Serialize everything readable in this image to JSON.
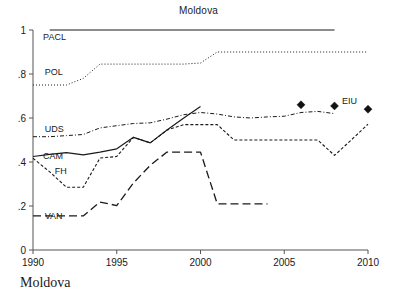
{
  "figure": {
    "title": "Moldova",
    "caption": "Moldova"
  },
  "chart_data": {
    "type": "line",
    "title": "Moldova",
    "xlabel": "",
    "ylabel": "",
    "xlim": [
      1990,
      2010
    ],
    "ylim": [
      0,
      1
    ],
    "grid": false,
    "legend": "inline-labels",
    "xticks": [
      "1990",
      "1995",
      "2000",
      "2005",
      "2010"
    ],
    "yticks": [
      "0",
      ".2",
      ".4",
      ".6",
      ".8",
      "1"
    ],
    "ytick_values": [
      0,
      0.2,
      0.4,
      0.6,
      0.8,
      1
    ],
    "xtick_values": [
      1990,
      1995,
      2000,
      2005,
      2010
    ],
    "series": [
      {
        "name": "PACL",
        "label": "PACL",
        "style": "solid",
        "label_x": 1990.6,
        "label_y": 0.955,
        "x": [
          1991,
          1992,
          1993,
          1994,
          1995,
          1996,
          1997,
          1998,
          1999,
          2000,
          2001,
          2002,
          2003,
          2004,
          2005,
          2006,
          2007,
          2008
        ],
        "values": [
          1,
          1,
          1,
          1,
          1,
          1,
          1,
          1,
          1,
          1,
          1,
          1,
          1,
          1,
          1,
          1,
          1,
          1
        ]
      },
      {
        "name": "POL",
        "label": "POL",
        "style": "dotted",
        "label_x": 1990.7,
        "label_y": 0.795,
        "x": [
          1990,
          1991,
          1992,
          1993,
          1994,
          1995,
          1996,
          1997,
          1998,
          1999,
          2000,
          2001,
          2002,
          2003,
          2004,
          2005,
          2006,
          2007,
          2008,
          2009,
          2010
        ],
        "values": [
          0.75,
          0.75,
          0.75,
          0.78,
          0.845,
          0.845,
          0.845,
          0.845,
          0.845,
          0.845,
          0.85,
          0.9,
          0.9,
          0.9,
          0.9,
          0.9,
          0.9,
          0.9,
          0.9,
          0.9,
          0.9
        ]
      },
      {
        "name": "UDS",
        "label": "UDS",
        "style": "dash-dot",
        "label_x": 1990.7,
        "label_y": 0.535,
        "x": [
          1990,
          1991,
          1992,
          1993,
          1994,
          1995,
          1996,
          1997,
          1998,
          1999,
          2000,
          2001,
          2002,
          2003,
          2004,
          2005,
          2006,
          2007,
          2008
        ],
        "values": [
          0.515,
          0.515,
          0.52,
          0.525,
          0.555,
          0.565,
          0.575,
          0.578,
          0.595,
          0.615,
          0.625,
          0.618,
          0.605,
          0.6,
          0.605,
          0.608,
          0.625,
          0.63,
          0.62
        ]
      },
      {
        "name": "CAM",
        "label": "CAM",
        "style": "solid",
        "label_x": 1990.6,
        "label_y": 0.415,
        "x": [
          1990,
          1991,
          1992,
          1993,
          1994,
          1995,
          1996,
          1997,
          1998,
          1999,
          2000
        ],
        "values": [
          0.425,
          0.435,
          0.443,
          0.432,
          0.445,
          0.46,
          0.512,
          0.487,
          0.545,
          0.6,
          0.652
        ]
      },
      {
        "name": "FH",
        "label": "FH",
        "style": "short-dash",
        "label_x": 1991.3,
        "label_y": 0.345,
        "x": [
          1990,
          1991,
          1992,
          1993,
          1994,
          1995,
          1996,
          1997,
          1998,
          1999,
          2000,
          2001,
          2002,
          2003,
          2004,
          2005,
          2006,
          2007,
          2008,
          2009,
          2010
        ],
        "values": [
          0.417,
          0.355,
          0.285,
          0.285,
          0.418,
          0.425,
          0.512,
          0.487,
          0.545,
          0.57,
          0.57,
          0.57,
          0.5,
          0.5,
          0.5,
          0.5,
          0.5,
          0.5,
          0.43,
          0.5,
          0.572
        ]
      },
      {
        "name": "VAN",
        "label": "VAN",
        "style": "long-dash",
        "label_x": 1990.7,
        "label_y": 0.143,
        "x": [
          1990,
          1991,
          1992,
          1993,
          1994,
          1995,
          1996,
          1997,
          1998,
          1999,
          2000,
          2001,
          2002,
          2003,
          2004
        ],
        "values": [
          0.155,
          0.155,
          0.155,
          0.155,
          0.218,
          0.202,
          0.305,
          0.385,
          0.445,
          0.445,
          0.445,
          0.21,
          0.21,
          0.21,
          0.21
        ]
      }
    ],
    "markers": {
      "name": "EIU",
      "label": "EIU",
      "symbol": "diamond",
      "label_x": 2008.45,
      "label_y": 0.665,
      "points": [
        {
          "x": 2006,
          "y": 0.66
        },
        {
          "x": 2008,
          "y": 0.655
        },
        {
          "x": 2010,
          "y": 0.64
        }
      ]
    }
  }
}
